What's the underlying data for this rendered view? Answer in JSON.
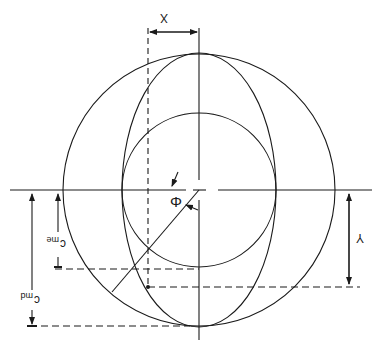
{
  "diagram": {
    "title": "",
    "labels": {
      "x_dimension": "X",
      "y_dimension": "Y",
      "angle": "Φ",
      "c_me": "c",
      "c_me_sub": "me",
      "c_md": "c",
      "c_md_sub": "md"
    },
    "colors": {
      "stroke": "#1a1a1a",
      "background": "#ffffff"
    },
    "geometry": {
      "center": [
        199,
        190
      ],
      "outer_circle_radius": 136,
      "inner_circle_radius": 77,
      "ellipse_rx": 77,
      "ellipse_ry": 137,
      "dashed_vertical_x": 148
    },
    "orientation": "rotated 180°"
  }
}
